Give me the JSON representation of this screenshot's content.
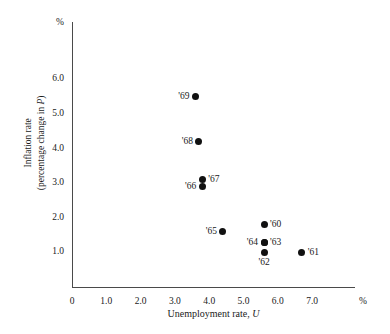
{
  "chart_data": {
    "type": "scatter",
    "title": "",
    "xlabel": "Unemployment rate, U",
    "ylabel": "Inflation rate (percentage change in P)",
    "ylabel_line1": "Inflation rate",
    "ylabel_line2": "(percentage change in P)",
    "x_unit": "%",
    "y_unit": "%",
    "xlim": [
      0,
      8.2
    ],
    "ylim": [
      0,
      7.1
    ],
    "grid": false,
    "legend": "none",
    "x_ticks": [
      "0",
      "1.0",
      "2.0",
      "3.0",
      "4.0",
      "5.0",
      "6.0",
      "7.0"
    ],
    "x_tick_values": [
      0,
      1.0,
      2.0,
      3.0,
      4.0,
      5.0,
      6.0,
      7.0
    ],
    "y_ticks": [
      "1.0",
      "2.0",
      "3.0",
      "4.0",
      "5.0",
      "6.0"
    ],
    "y_tick_values": [
      1.0,
      2.0,
      3.0,
      4.0,
      5.0,
      6.0
    ],
    "y_origin_label": "0",
    "points": [
      {
        "label": "'69",
        "x": 3.6,
        "y": 5.5,
        "label_pos": "left"
      },
      {
        "label": "'68",
        "x": 3.7,
        "y": 4.2,
        "label_pos": "left"
      },
      {
        "label": "'67",
        "x": 3.8,
        "y": 3.1,
        "label_pos": "right"
      },
      {
        "label": "'66",
        "x": 3.8,
        "y": 2.9,
        "label_pos": "left"
      },
      {
        "label": "'65",
        "x": 4.4,
        "y": 1.6,
        "label_pos": "left"
      },
      {
        "label": "'60",
        "x": 5.6,
        "y": 1.8,
        "label_pos": "right"
      },
      {
        "label": "'64",
        "x": 5.6,
        "y": 1.3,
        "label_pos": "left"
      },
      {
        "label": "'63",
        "x": 5.6,
        "y": 1.3,
        "label_pos": "right"
      },
      {
        "label": "'62",
        "x": 5.6,
        "y": 1.0,
        "label_pos": "below"
      },
      {
        "label": "'61",
        "x": 6.7,
        "y": 1.0,
        "label_pos": "right"
      }
    ],
    "colors": {
      "marker": "#111111",
      "axis": "#4a4a4a",
      "text": "#1a1a1a",
      "background": "#ffffff"
    }
  }
}
